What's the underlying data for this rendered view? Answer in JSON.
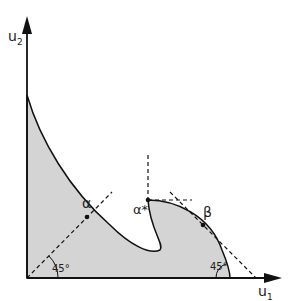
{
  "axes": {
    "x_label": "u",
    "x_sub": "1",
    "y_label": "u",
    "y_sub": "2"
  },
  "points": {
    "alpha": "α",
    "alpha_star": "α*",
    "beta": "β"
  },
  "angles": {
    "left": "45°",
    "right": "45°"
  },
  "colors": {
    "fill": "#d4d4d4",
    "stroke": "#111111"
  }
}
